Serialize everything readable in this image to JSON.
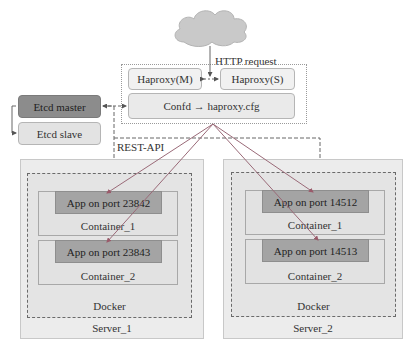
{
  "cloud": {
    "label": "HTTP  request",
    "icon": "cloud-icon"
  },
  "proxy_group": {
    "haproxy_master": "Haproxy(M)",
    "haproxy_slave": "Haproxy(S)",
    "confd": "Confd → haproxy.cfg"
  },
  "etcd": {
    "master": "Etcd master",
    "slave": "Etcd slave"
  },
  "rest_api_label": "REST-API",
  "servers": [
    {
      "name": "Server_1",
      "runtime": "Docker",
      "containers": [
        {
          "name": "Container_1",
          "app": "App on port   23842"
        },
        {
          "name": "Container_2",
          "app": "App on port   23843"
        }
      ]
    },
    {
      "name": "Server_2",
      "runtime": "Docker",
      "containers": [
        {
          "name": "Container_1",
          "app": "App on port   14512"
        },
        {
          "name": "Container_2",
          "app": "App on port   14513"
        }
      ]
    }
  ],
  "colors": {
    "etcd_master": "#8c8c8c",
    "etcd_slave": "#e3e3e3",
    "app_box": "#a4a4a4",
    "server_bg": "#ececec",
    "arrow": "#b07080"
  }
}
